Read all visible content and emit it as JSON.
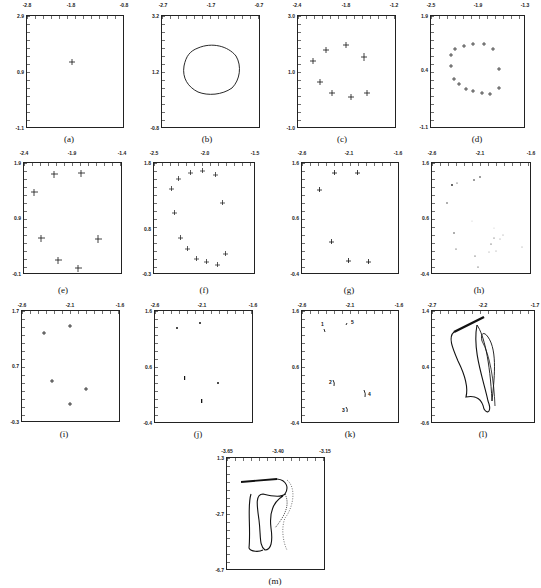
{
  "figure": {
    "panels": [
      {
        "id": "a",
        "caption": "(a)",
        "x_ticks": [
          "-2.8",
          "-1.8",
          "-0.8"
        ],
        "y_ticks": [
          "2.9",
          "0.9",
          "-1.1"
        ],
        "content": "single fixed point"
      },
      {
        "id": "b",
        "caption": "(b)",
        "x_ticks": [
          "-2.7",
          "-1.7",
          "-0.7"
        ],
        "y_ticks": [
          "3.2",
          "1.2",
          "-0.8"
        ],
        "content": "closed invariant curve"
      },
      {
        "id": "c",
        "caption": "(c)",
        "x_ticks": [
          "-2.4",
          "-1.8",
          "-1.2"
        ],
        "y_ticks": [
          "3.0",
          "1.0",
          "-1.0"
        ],
        "content": "9-point periodic orbit"
      },
      {
        "id": "d",
        "caption": "(d)",
        "x_ticks": [
          "-2.5",
          "-1.9",
          "-1.3"
        ],
        "y_ticks": [
          "1.9",
          "0.4",
          "-1.1"
        ],
        "content": "16-point periodic orbit"
      },
      {
        "id": "e",
        "caption": "(e)",
        "x_ticks": [
          "-2.4",
          "-1.9",
          "-1.4"
        ],
        "y_ticks": [
          "1.9",
          "0.9",
          "-0.1"
        ],
        "content": "7-point periodic orbit"
      },
      {
        "id": "f",
        "caption": "(f)",
        "x_ticks": [
          "-2.5",
          "-2.0",
          "-1.5"
        ],
        "y_ticks": [
          "1.8",
          "0.8",
          "-0.3"
        ],
        "content": "14-point periodic orbit"
      },
      {
        "id": "g",
        "caption": "(g)",
        "x_ticks": [
          "-2.6",
          "-2.1",
          "-1.6"
        ],
        "y_ticks": [
          "1.6",
          "0.6",
          "-0.4"
        ],
        "content": "6-point periodic orbit"
      },
      {
        "id": "h",
        "caption": "(h)",
        "x_ticks": [
          "-2.6",
          "-2.1",
          "-1.6"
        ],
        "y_ticks": [
          "1.6",
          "0.6",
          "-0.4"
        ],
        "content": "scattered points"
      },
      {
        "id": "i",
        "caption": "(i)",
        "x_ticks": [
          "-2.6",
          "-2.1",
          "-1.6"
        ],
        "y_ticks": [
          "1.7",
          "0.7",
          "-0.3"
        ],
        "content": "5-point periodic orbit"
      },
      {
        "id": "j",
        "caption": "(j)",
        "x_ticks": [
          "-2.6",
          "-2.1",
          "-1.6"
        ],
        "y_ticks": [
          "1.6",
          "0.6",
          "-0.4"
        ],
        "content": "5 small clusters"
      },
      {
        "id": "k",
        "caption": "(k)",
        "x_ticks": [
          "-2.6",
          "-2.1",
          "-1.6"
        ],
        "y_ticks": [
          "1.6",
          "0.6",
          "-0.4"
        ],
        "content": "5 labelled arcs",
        "labels": [
          "1",
          "2",
          "3",
          "4",
          "5"
        ]
      },
      {
        "id": "l",
        "caption": "(l)",
        "x_ticks": [
          "-2.7",
          "-2.2",
          "-1.7"
        ],
        "y_ticks": [
          "1.4",
          "0.4",
          "-0.6"
        ],
        "content": "chaotic attractor"
      },
      {
        "id": "m",
        "caption": "(m)",
        "x_ticks": [
          "-3.65",
          "-3.40",
          "-3.15"
        ],
        "y_ticks": [
          "1.3",
          "-2.7",
          "-6.7"
        ],
        "content": "chaotic attractor"
      }
    ]
  }
}
